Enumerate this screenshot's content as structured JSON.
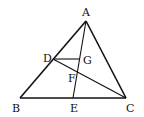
{
  "diagram": {
    "type": "geometry-triangle",
    "points": {
      "A": {
        "label": "A",
        "x": 86,
        "y": 21
      },
      "B": {
        "label": "B",
        "x": 20,
        "y": 98
      },
      "C": {
        "label": "C",
        "x": 126,
        "y": 98
      },
      "D": {
        "label": "D",
        "x": 53,
        "y": 59
      },
      "E": {
        "label": "E",
        "x": 73,
        "y": 98
      },
      "F": {
        "label": "F",
        "x": 77,
        "y": 71
      },
      "G": {
        "label": "G",
        "x": 80,
        "y": 59
      }
    },
    "segments": [
      "AB",
      "BC",
      "CA",
      "AE",
      "DC",
      "DG"
    ],
    "labels": {
      "A": "A",
      "B": "B",
      "C": "C",
      "D": "D",
      "E": "E",
      "F": "F",
      "G": "G"
    }
  }
}
